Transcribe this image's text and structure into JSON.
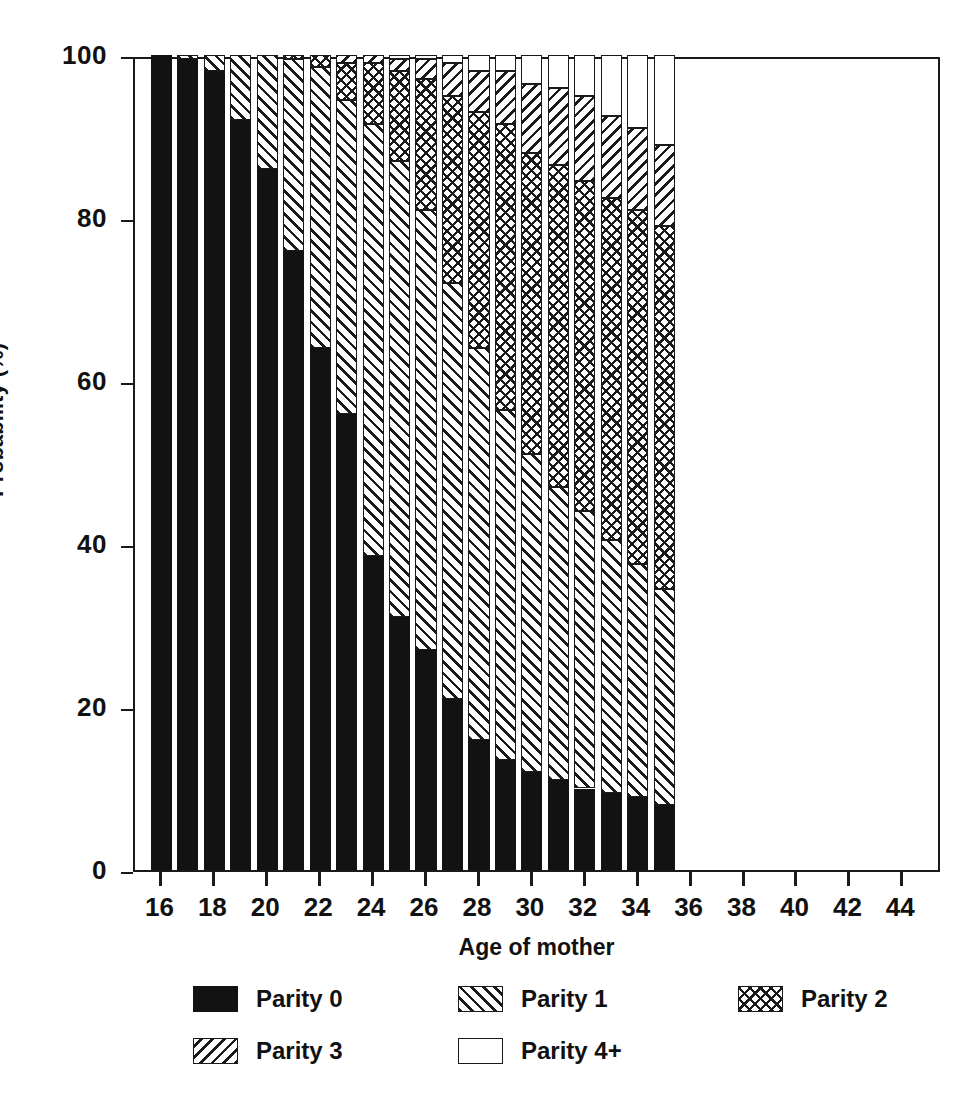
{
  "chart_data": {
    "type": "bar",
    "subtype": "stacked-bar-100",
    "title": "",
    "xlabel": "Age of mother",
    "ylabel": "Probability (%)",
    "xlim": [
      15,
      45.5
    ],
    "ylim": [
      0,
      100
    ],
    "grid": false,
    "legend_position": "bottom",
    "xticks": [
      "16",
      "18",
      "20",
      "22",
      "24",
      "26",
      "28",
      "30",
      "32",
      "34",
      "36",
      "38",
      "40",
      "42",
      "44"
    ],
    "xtick_values": [
      16,
      18,
      20,
      22,
      24,
      26,
      28,
      30,
      32,
      34,
      36,
      38,
      40,
      42,
      44
    ],
    "yticks": [
      "0",
      "20",
      "40",
      "60",
      "80",
      "100"
    ],
    "ytick_values": [
      0,
      20,
      40,
      60,
      80,
      100
    ],
    "categories": [
      16,
      17,
      18,
      19,
      20,
      21,
      22,
      23,
      24,
      25,
      26,
      27,
      28,
      29,
      30,
      31,
      32,
      33,
      34,
      35
    ],
    "series": [
      {
        "name": "Parity 0",
        "pattern": "solid-black",
        "values": [
          100,
          99.5,
          98,
          92,
          86,
          76,
          64,
          56,
          38.5,
          31,
          27,
          21,
          16,
          13.5,
          12,
          11,
          10,
          9.5,
          9,
          8
        ]
      },
      {
        "name": "Parity 1",
        "pattern": "forward-hatch",
        "values": [
          0,
          0.5,
          2,
          8,
          14,
          23.5,
          34.5,
          38.5,
          53,
          56,
          54,
          51,
          48,
          43,
          39,
          36,
          34,
          31,
          28.5,
          26.5
        ]
      },
      {
        "name": "Parity 2",
        "pattern": "cross-hatch",
        "values": [
          0,
          0,
          0,
          0,
          0,
          0.5,
          1.5,
          4.5,
          7.5,
          11,
          16,
          23,
          29,
          35,
          37,
          39.5,
          40.5,
          42,
          43.5,
          44.5
        ]
      },
      {
        "name": "Parity 3",
        "pattern": "back-hatch",
        "values": [
          0,
          0,
          0,
          0,
          0,
          0,
          0,
          1,
          1,
          1.5,
          2.5,
          4,
          5,
          6.5,
          8.5,
          9.5,
          10.5,
          10,
          10,
          10
        ]
      },
      {
        "name": "Parity 4+",
        "pattern": "white-empty",
        "values": [
          0,
          0,
          0,
          0,
          0,
          0,
          0,
          0,
          0,
          0.5,
          0.5,
          1,
          2,
          2,
          3.5,
          4,
          5,
          7.5,
          9,
          11
        ]
      }
    ]
  },
  "axes": {
    "y_title": "Probability (%)",
    "x_title": "Age of mother"
  },
  "legend": {
    "items": [
      {
        "label": "Parity 0",
        "pattern": "solid-black"
      },
      {
        "label": "Parity 1",
        "pattern": "forward-hatch"
      },
      {
        "label": "Parity 2",
        "pattern": "cross-hatch"
      },
      {
        "label": "Parity 3",
        "pattern": "back-hatch"
      },
      {
        "label": "Parity 4+",
        "pattern": "white-empty"
      }
    ]
  },
  "colors": {
    "ink": "#1a1a1a",
    "fill_black": "#121212",
    "background": "#ffffff"
  }
}
